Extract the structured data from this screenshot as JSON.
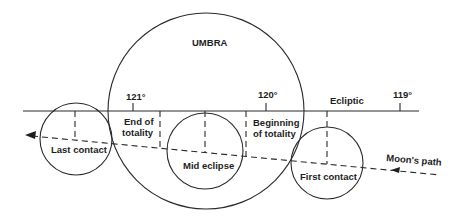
{
  "diagram": {
    "umbra_label": "UMBRA",
    "ecliptic_label": "Ecliptic",
    "moon_path_label": "Moon's path",
    "longitude_ticks": [
      {
        "label": "121°",
        "x": 133
      },
      {
        "label": "120°",
        "x": 266
      },
      {
        "label": "119°",
        "x": 400
      }
    ],
    "events": {
      "last_contact": "Last contact",
      "end_of_totality_1": "End of",
      "end_of_totality_2": "totality",
      "mid_eclipse": "Mid eclipse",
      "beginning_of_totality_1": "Beginning",
      "beginning_of_totality_2": "of totality",
      "first_contact": "First contact"
    },
    "colors": {
      "line": "#2a2a2a",
      "text": "#1e1e1e",
      "background": "#ffffff"
    }
  }
}
